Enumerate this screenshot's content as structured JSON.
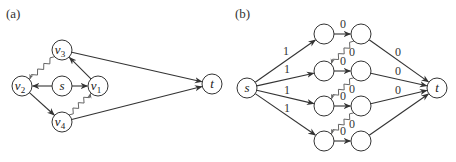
{
  "panels": [
    {
      "id": "a",
      "label": "(a)",
      "nodes": [
        {
          "id": "v3",
          "name": "v",
          "sub": "3"
        },
        {
          "id": "v2",
          "name": "v",
          "sub": "2"
        },
        {
          "id": "s",
          "name": "s",
          "sub": ""
        },
        {
          "id": "v1",
          "name": "v",
          "sub": "1"
        },
        {
          "id": "v4",
          "name": "v",
          "sub": "4"
        },
        {
          "id": "t",
          "name": "t",
          "sub": ""
        }
      ],
      "edges": [
        {
          "from": "s",
          "to": "v2",
          "style": "straight",
          "label": ""
        },
        {
          "from": "s",
          "to": "v1",
          "style": "straight",
          "label": ""
        },
        {
          "from": "v1",
          "to": "v3",
          "style": "straight",
          "label": ""
        },
        {
          "from": "v3",
          "to": "v2",
          "style": "wavy",
          "label": ""
        },
        {
          "from": "v2",
          "to": "v4",
          "style": "straight",
          "label": ""
        },
        {
          "from": "v4",
          "to": "v1",
          "style": "wavy",
          "label": ""
        },
        {
          "from": "v3",
          "to": "t",
          "style": "straight",
          "label": ""
        },
        {
          "from": "v4",
          "to": "t",
          "style": "straight",
          "label": ""
        }
      ]
    },
    {
      "id": "b",
      "label": "(b)",
      "nodes": [
        {
          "id": "s",
          "name": "s",
          "sub": ""
        },
        {
          "id": "a1",
          "name": "",
          "sub": ""
        },
        {
          "id": "b1",
          "name": "",
          "sub": ""
        },
        {
          "id": "a2",
          "name": "",
          "sub": ""
        },
        {
          "id": "b2",
          "name": "",
          "sub": ""
        },
        {
          "id": "a3",
          "name": "",
          "sub": ""
        },
        {
          "id": "b3",
          "name": "",
          "sub": ""
        },
        {
          "id": "a4",
          "name": "",
          "sub": ""
        },
        {
          "id": "b4",
          "name": "",
          "sub": ""
        },
        {
          "id": "t",
          "name": "t",
          "sub": ""
        }
      ],
      "edges": [
        {
          "from": "s",
          "to": "a1",
          "style": "straight",
          "label": "1"
        },
        {
          "from": "s",
          "to": "a2",
          "style": "straight",
          "label": "1"
        },
        {
          "from": "s",
          "to": "a3",
          "style": "straight",
          "label": "1"
        },
        {
          "from": "s",
          "to": "a4",
          "style": "straight",
          "label": "1"
        },
        {
          "from": "a1",
          "to": "b1",
          "style": "straight",
          "label": "0"
        },
        {
          "from": "a2",
          "to": "b2",
          "style": "straight",
          "label": "0"
        },
        {
          "from": "a3",
          "to": "b3",
          "style": "straight",
          "label": "0"
        },
        {
          "from": "a4",
          "to": "b4",
          "style": "straight",
          "label": "0"
        },
        {
          "from": "b1",
          "to": "a2",
          "style": "wavy",
          "label": "0"
        },
        {
          "from": "b2",
          "to": "a3",
          "style": "wavy",
          "label": "0"
        },
        {
          "from": "b3",
          "to": "a4",
          "style": "wavy",
          "label": "0"
        },
        {
          "from": "b1",
          "to": "t",
          "style": "straight",
          "label": "0"
        },
        {
          "from": "b2",
          "to": "t",
          "style": "straight",
          "label": "0"
        },
        {
          "from": "b3",
          "to": "t",
          "style": "straight",
          "label": "0"
        },
        {
          "from": "b4",
          "to": "t",
          "style": "straight",
          "label": ""
        }
      ]
    }
  ]
}
